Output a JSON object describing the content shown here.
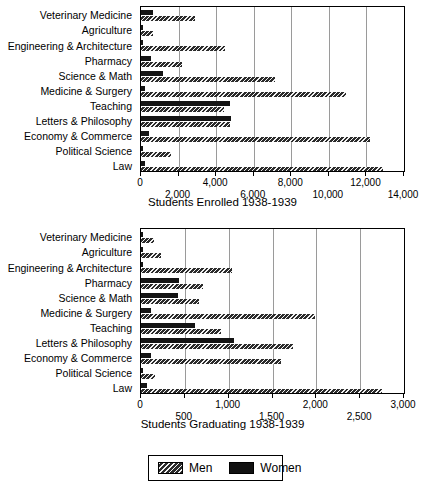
{
  "figure": {
    "categories": [
      "Veterinary Medicine",
      "Agriculture",
      "Engineering & Architecture",
      "Pharmacy",
      "Science & Math",
      "Medicine & Surgery",
      "Teaching",
      "Letters & Philosophy",
      "Economy & Commerce",
      "Political Science",
      "Law"
    ],
    "legend": {
      "men_label": "Men",
      "women_label": "Women",
      "men_swatch": "diagonal-hatch-icon",
      "women_swatch": "solid-black-icon"
    }
  },
  "chart_data": [
    {
      "id": "enrolled",
      "type": "bar",
      "orientation": "horizontal",
      "title": "",
      "xlabel": "Students Enrolled 1938-1939",
      "ylabel": "",
      "xlim": [
        0,
        14000
      ],
      "xticks": [
        0,
        2000,
        4000,
        6000,
        8000,
        10000,
        12000,
        14000
      ],
      "xticklabels": [
        "0",
        "2,000",
        "4,000",
        "6,000",
        "8,000",
        "10,000",
        "12,000",
        "14,000"
      ],
      "grid": true,
      "legend_position": "below-figure",
      "categories": [
        "Veterinary Medicine",
        "Agriculture",
        "Engineering & Architecture",
        "Pharmacy",
        "Science & Math",
        "Medicine & Surgery",
        "Teaching",
        "Letters & Philosophy",
        "Economy & Commerce",
        "Political Science",
        "Law"
      ],
      "series": [
        {
          "name": "Women",
          "values": [
            620,
            60,
            90,
            540,
            1180,
            220,
            4750,
            4800,
            430,
            40,
            200
          ]
        },
        {
          "name": "Men",
          "values": [
            2850,
            640,
            4450,
            2200,
            7150,
            10900,
            4400,
            4750,
            12200,
            1620,
            12900
          ]
        }
      ]
    },
    {
      "id": "graduating",
      "type": "bar",
      "orientation": "horizontal",
      "title": "",
      "xlabel": "Students Graduating 1938-1939",
      "ylabel": "",
      "xlim": [
        0,
        3000
      ],
      "xticks": [
        0,
        500,
        1000,
        1500,
        2000,
        2500,
        3000
      ],
      "xticklabels": [
        "0",
        "500",
        "1,000",
        "1,500",
        "2,000",
        "2,500",
        "3,000"
      ],
      "grid": true,
      "legend_position": "below-figure",
      "categories": [
        "Veterinary Medicine",
        "Agriculture",
        "Engineering & Architecture",
        "Pharmacy",
        "Science & Math",
        "Medicine & Surgery",
        "Teaching",
        "Letters & Philosophy",
        "Economy & Commerce",
        "Political Science",
        "Law"
      ],
      "series": [
        {
          "name": "Women",
          "values": [
            10,
            15,
            20,
            430,
            420,
            110,
            620,
            1060,
            110,
            20,
            70
          ]
        },
        {
          "name": "Men",
          "values": [
            150,
            230,
            1040,
            710,
            660,
            1990,
            910,
            1730,
            1600,
            160,
            2750
          ]
        }
      ]
    }
  ]
}
